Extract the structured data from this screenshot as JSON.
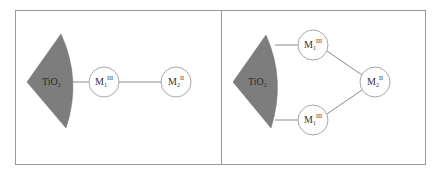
{
  "diagram": {
    "panels": [
      {
        "id": "left",
        "description": "Single anchoring: TiO2 bound to M1(III), which bonds to M2(II)",
        "surface": {
          "label_main": "TiO",
          "label_sub": "2"
        },
        "nodes": [
          {
            "id": "m1",
            "label_main": "M",
            "label_sub": "1",
            "label_sup": "III"
          },
          {
            "id": "m2",
            "label_main": "M",
            "label_sub": "2",
            "label_sup": "II"
          }
        ],
        "edges": [
          [
            "surface",
            "m1"
          ],
          [
            "m1",
            "m2"
          ]
        ]
      },
      {
        "id": "right",
        "description": "Double anchoring: TiO2 bound to two M1(III) centres bridging to M2(II)",
        "surface": {
          "label_main": "TiO",
          "label_sub": "2"
        },
        "nodes": [
          {
            "id": "m1_top",
            "label_main": "M",
            "label_sub": "1",
            "label_sup": "III"
          },
          {
            "id": "m1_bottom",
            "label_main": "M",
            "label_sub": "1",
            "label_sup": "III"
          },
          {
            "id": "m2",
            "label_main": "M",
            "label_sub": "2",
            "label_sup": "II"
          }
        ],
        "edges": [
          [
            "surface",
            "m1_top"
          ],
          [
            "surface",
            "m1_bottom"
          ],
          [
            "m1_top",
            "m2"
          ],
          [
            "m1_bottom",
            "m2"
          ]
        ]
      }
    ],
    "colors": {
      "surface_fill": "#7d7d7d",
      "node_stroke": "#a8a8a8",
      "line": "#8a8a8a",
      "frame": "#9a9a9a"
    }
  }
}
